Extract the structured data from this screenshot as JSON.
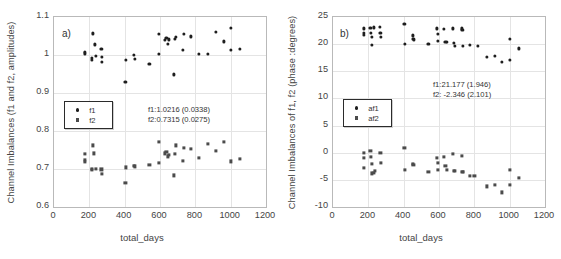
{
  "chart_data": [
    {
      "type": "scatter",
      "panel_label": "a)",
      "title": "",
      "xlabel": "total_days",
      "ylabel": "Channel Imbalances (f1 and f2, amplitudes)",
      "xlim": [
        0,
        1200
      ],
      "ylim": [
        0.6,
        1.1
      ],
      "xticks": [
        0,
        200,
        400,
        600,
        800,
        1000,
        1200
      ],
      "yticks": [
        0.6,
        0.7,
        0.8,
        0.9,
        1,
        1.1
      ],
      "grid": true,
      "legend_position": "center-left",
      "annotations": [
        "f1:1.0216 (0.0338)",
        "f2:0.7315 (0.0275)"
      ],
      "series": [
        {
          "name": "f1",
          "marker": "circle",
          "color": "#1e1e1e",
          "points": [
            [
              173,
              1.004
            ],
            [
              174,
              1.008
            ],
            [
              214,
              0.993
            ],
            [
              215,
              0.988
            ],
            [
              218,
              1.057
            ],
            [
              230,
              1.028
            ],
            [
              236,
              0.998
            ],
            [
              268,
              1.017
            ],
            [
              269,
              0.994
            ],
            [
              270,
              0.981
            ],
            [
              404,
              0.93
            ],
            [
              407,
              0.988
            ],
            [
              450,
              1.0
            ],
            [
              457,
              0.989
            ],
            [
              540,
              0.977
            ],
            [
              592,
              1.055
            ],
            [
              594,
              1.003
            ],
            [
              630,
              1.04
            ],
            [
              636,
              1.044
            ],
            [
              645,
              1.03
            ],
            [
              652,
              1.041
            ],
            [
              680,
              0.949
            ],
            [
              686,
              1.043
            ],
            [
              692,
              1.048
            ],
            [
              728,
              1.013
            ],
            [
              735,
              1.055
            ],
            [
              775,
              1.049
            ],
            [
              820,
              1.002
            ],
            [
              872,
              1.003
            ],
            [
              918,
              1.06
            ],
            [
              960,
              1.036
            ],
            [
              1000,
              1.072
            ],
            [
              1003,
              1.013
            ],
            [
              1050,
              1.017
            ]
          ]
        },
        {
          "name": "f2",
          "marker": "square",
          "color": "#4b4b4b",
          "points": [
            [
              173,
              0.724
            ],
            [
              174,
              0.718
            ],
            [
              177,
              0.739
            ],
            [
              214,
              0.7
            ],
            [
              216,
              0.697
            ],
            [
              219,
              0.762
            ],
            [
              228,
              0.741
            ],
            [
              236,
              0.7
            ],
            [
              268,
              0.699
            ],
            [
              270,
              0.687
            ],
            [
              404,
              0.663
            ],
            [
              407,
              0.704
            ],
            [
              450,
              0.708
            ],
            [
              457,
              0.707
            ],
            [
              540,
              0.711
            ],
            [
              592,
              0.716
            ],
            [
              594,
              0.772
            ],
            [
              630,
              0.741
            ],
            [
              636,
              0.744
            ],
            [
              645,
              0.733
            ],
            [
              652,
              0.737
            ],
            [
              680,
              0.683
            ],
            [
              686,
              0.74
            ],
            [
              692,
              0.762
            ],
            [
              728,
              0.722
            ],
            [
              735,
              0.755
            ],
            [
              775,
              0.753
            ],
            [
              820,
              0.729
            ],
            [
              872,
              0.766
            ],
            [
              918,
              0.747
            ],
            [
              960,
              0.772
            ],
            [
              1000,
              0.72
            ],
            [
              1050,
              0.727
            ]
          ]
        }
      ]
    },
    {
      "type": "scatter",
      "panel_label": "b)",
      "title": "",
      "xlabel": "total_days",
      "ylabel": "Channel Imbalances of f1, f2 (phase :degrees)",
      "xlim": [
        0,
        1200
      ],
      "ylim": [
        -10,
        25
      ],
      "xticks": [
        0,
        200,
        400,
        600,
        800,
        1000,
        1200
      ],
      "yticks": [
        -10,
        -5,
        0,
        5,
        10,
        15,
        20,
        25
      ],
      "grid": true,
      "legend_position": "center-left",
      "annotations": [
        "f1:21.177 (1.946)",
        "f2: -2.346 (2.101)"
      ],
      "series": [
        {
          "name": "af1",
          "marker": "circle",
          "color": "#1e1e1e",
          "points": [
            [
              173,
              22.9
            ],
            [
              174,
              22.1
            ],
            [
              176,
              21.7
            ],
            [
              212,
              23.0
            ],
            [
              214,
              22.1
            ],
            [
              218,
              21.3
            ],
            [
              222,
              19.9
            ],
            [
              230,
              23.1
            ],
            [
              265,
              23.2
            ],
            [
              268,
              22.0
            ],
            [
              270,
              21.3
            ],
            [
              404,
              23.8
            ],
            [
              407,
              20.0
            ],
            [
              450,
              21.6
            ],
            [
              455,
              21.0
            ],
            [
              458,
              20.8
            ],
            [
              540,
              20.0
            ],
            [
              590,
              22.9
            ],
            [
              592,
              21.9
            ],
            [
              596,
              20.6
            ],
            [
              630,
              22.8
            ],
            [
              636,
              20.4
            ],
            [
              645,
              20.4
            ],
            [
              680,
              22.9
            ],
            [
              686,
              20.3
            ],
            [
              692,
              19.7
            ],
            [
              728,
              22.9
            ],
            [
              732,
              22.6
            ],
            [
              735,
              19.7
            ],
            [
              775,
              19.9
            ],
            [
              820,
              19.7
            ],
            [
              872,
              17.7
            ],
            [
              918,
              17.8
            ],
            [
              955,
              16.7
            ],
            [
              1000,
              20.9
            ],
            [
              1003,
              17.1
            ],
            [
              1050,
              19.2
            ]
          ]
        },
        {
          "name": "af2",
          "marker": "square",
          "color": "#4b4b4b",
          "points": [
            [
              173,
              -1.0
            ],
            [
              174,
              -2.8
            ],
            [
              176,
              -0.1
            ],
            [
              212,
              0.4
            ],
            [
              214,
              -0.8
            ],
            [
              218,
              -2.1
            ],
            [
              222,
              -3.8
            ],
            [
              230,
              -3.7
            ],
            [
              236,
              -3.4
            ],
            [
              268,
              -0.1
            ],
            [
              270,
              -1.9
            ],
            [
              404,
              0.9
            ],
            [
              407,
              -3.1
            ],
            [
              450,
              -2.0
            ],
            [
              455,
              -2.2
            ],
            [
              540,
              -3.5
            ],
            [
              590,
              -1.0
            ],
            [
              592,
              -1.9
            ],
            [
              596,
              -3.2
            ],
            [
              630,
              -0.8
            ],
            [
              636,
              -2.4
            ],
            [
              645,
              -3.2
            ],
            [
              680,
              -0.2
            ],
            [
              686,
              -3.3
            ],
            [
              692,
              -3.4
            ],
            [
              728,
              -0.6
            ],
            [
              732,
              -3.5
            ],
            [
              735,
              -3.6
            ],
            [
              775,
              -4.2
            ],
            [
              800,
              -4.3
            ],
            [
              872,
              -6.2
            ],
            [
              918,
              -6.0
            ],
            [
              955,
              -7.3
            ],
            [
              1000,
              -3.1
            ],
            [
              1003,
              -5.9
            ],
            [
              1050,
              -4.6
            ]
          ]
        }
      ]
    }
  ]
}
